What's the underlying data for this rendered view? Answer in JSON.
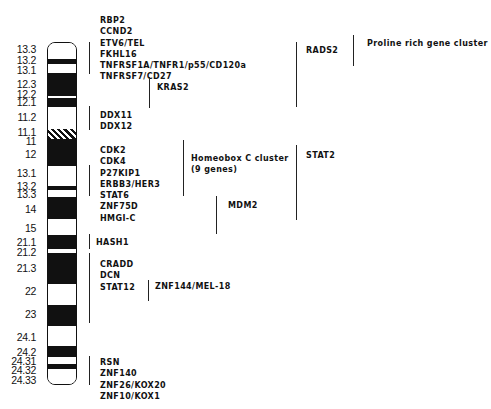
{
  "figure": {
    "chromosome": {
      "name": "chromosome-12",
      "top": 42,
      "bottom": 385,
      "bands": [
        {
          "label": "13.3",
          "type": "white",
          "y0": 42,
          "y1": 58,
          "label_y": 44
        },
        {
          "label": "13.2",
          "type": "black",
          "y0": 58,
          "y1": 63,
          "label_y": 55
        },
        {
          "label": "13.1",
          "type": "white",
          "y0": 63,
          "y1": 72,
          "label_y": 65
        },
        {
          "label": "12.3",
          "type": "black",
          "y0": 72,
          "y1": 85,
          "label_y": 79
        },
        {
          "label": "12.2",
          "type": "black",
          "y0": 85,
          "y1": 95,
          "label_y": 89
        },
        {
          "label": "",
          "type": "white",
          "y0": 95,
          "y1": 97,
          "label_y": null
        },
        {
          "label": "12.1",
          "type": "black",
          "y0": 97,
          "y1": 106,
          "label_y": 97
        },
        {
          "label": "11.2",
          "type": "white",
          "y0": 106,
          "y1": 128,
          "label_y": 112
        },
        {
          "label": "11.1",
          "type": "hatched",
          "y0": 128,
          "y1": 138,
          "label_y": 127
        },
        {
          "label": "11",
          "type": "black",
          "y0": 138,
          "y1": 143,
          "label_y": 136
        },
        {
          "label": "12",
          "type": "black",
          "y0": 143,
          "y1": 165,
          "label_y": 149
        },
        {
          "label": "13.1",
          "type": "white",
          "y0": 165,
          "y1": 185,
          "label_y": 168
        },
        {
          "label": "13.2",
          "type": "black",
          "y0": 185,
          "y1": 189,
          "label_y": 181
        },
        {
          "label": "13.3",
          "type": "white",
          "y0": 189,
          "y1": 196,
          "label_y": 189
        },
        {
          "label": "14",
          "type": "black",
          "y0": 196,
          "y1": 218,
          "label_y": 204
        },
        {
          "label": "15",
          "type": "white",
          "y0": 218,
          "y1": 234,
          "label_y": 223
        },
        {
          "label": "21.1",
          "type": "black",
          "y0": 234,
          "y1": 248,
          "label_y": 237
        },
        {
          "label": "21.2",
          "type": "white",
          "y0": 248,
          "y1": 252,
          "label_y": 247
        },
        {
          "label": "21.3",
          "type": "black",
          "y0": 252,
          "y1": 283,
          "label_y": 263
        },
        {
          "label": "22",
          "type": "white",
          "y0": 283,
          "y1": 304,
          "label_y": 286
        },
        {
          "label": "23",
          "type": "black",
          "y0": 304,
          "y1": 325,
          "label_y": 309
        },
        {
          "label": "24.1",
          "type": "white",
          "y0": 325,
          "y1": 345,
          "label_y": 332
        },
        {
          "label": "24.2",
          "type": "black",
          "y0": 345,
          "y1": 356,
          "label_y": 347
        },
        {
          "label": "24.31",
          "type": "white",
          "y0": 356,
          "y1": 363,
          "label_y": 356
        },
        {
          "label": "24.32",
          "type": "black",
          "y0": 363,
          "y1": 368,
          "label_y": 365
        },
        {
          "label": "24.33",
          "type": "white",
          "y0": 368,
          "y1": 385,
          "label_y": 375
        }
      ]
    },
    "gene_groups": [
      {
        "id": "group-12p13",
        "x": 100,
        "y": 15,
        "bracket": {
          "x": 89,
          "y0": 42,
          "y1": 74
        },
        "genes": [
          "RBP2",
          "CCND2",
          "ETV6/TEL",
          "FKHL16",
          "TNFRSF1A/TNFR1/p55/CD120a",
          "TNFRSF7/CD27"
        ]
      },
      {
        "id": "group-kras2",
        "x": 157,
        "y": 82,
        "bracket": {
          "x": 149,
          "y0": 77,
          "y1": 108
        },
        "genes": [
          "KRAS2"
        ]
      },
      {
        "id": "group-ddx",
        "x": 100,
        "y": 110,
        "bracket": {
          "x": 89,
          "y0": 106,
          "y1": 130
        },
        "genes": [
          "DDX11",
          "DDX12"
        ]
      },
      {
        "id": "group-12q13",
        "x": 100,
        "y": 145,
        "bracket": {
          "x": 89,
          "y0": 165,
          "y1": 196
        },
        "genes": [
          "CDK2",
          "CDK4",
          "P27KIP1",
          "ERBB3/HER3",
          "STAT6",
          "ZNF75D",
          "HMGI-C"
        ]
      },
      {
        "id": "group-homeobox",
        "x": 191,
        "y": 153,
        "bracket": {
          "x": 183,
          "y0": 140,
          "y1": 196
        },
        "genes": [
          "Homeobox C cluster",
          "(9 genes)"
        ]
      },
      {
        "id": "group-mdm2",
        "x": 228,
        "y": 200,
        "bracket": {
          "x": 216,
          "y0": 196,
          "y1": 234
        },
        "genes": [
          "MDM2"
        ]
      },
      {
        "id": "group-stat2",
        "x": 306,
        "y": 150,
        "bracket": {
          "x": 296,
          "y0": 145,
          "y1": 220
        },
        "genes": [
          "STAT2"
        ]
      },
      {
        "id": "group-hash1",
        "x": 96,
        "y": 237,
        "bracket": {
          "x": 89,
          "y0": 234,
          "y1": 249
        },
        "genes": [
          "HASH1"
        ]
      },
      {
        "id": "group-12q22",
        "x": 100,
        "y": 259,
        "bracket": {
          "x": 89,
          "y0": 253,
          "y1": 323
        },
        "genes": [
          "CRADD",
          "DCN",
          "STAT12"
        ]
      },
      {
        "id": "group-znf144",
        "x": 155,
        "y": 281,
        "bracket": {
          "x": 148,
          "y0": 280,
          "y1": 301
        },
        "genes": [
          "ZNF144/MEL-18"
        ]
      },
      {
        "id": "group-12q24",
        "x": 100,
        "y": 357,
        "bracket": {
          "x": 89,
          "y0": 356,
          "y1": 385
        },
        "genes": [
          "RSN",
          "ZNF140",
          "ZNF26/KOX20",
          "ZNF10/KOX1"
        ]
      },
      {
        "id": "group-rads2",
        "x": 306,
        "y": 45,
        "bracket": {
          "x": 296,
          "y0": 42,
          "y1": 107
        },
        "genes": [
          "RADS2"
        ]
      },
      {
        "id": "group-proline",
        "x": 367,
        "y": 38,
        "bracket": {
          "x": 353,
          "y0": 35,
          "y1": 66
        },
        "genes": [
          "Proline rich gene cluster"
        ]
      }
    ]
  }
}
